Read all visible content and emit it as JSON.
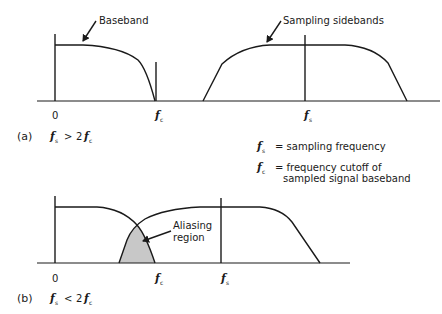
{
  "panel_a": {
    "tag": "(a)",
    "condition": {
      "f1": "f",
      "s1": "s",
      "op": ">",
      "k": "2",
      "f2": "f",
      "s2": "c"
    },
    "callouts": {
      "baseband": "Baseband",
      "sidebands": "Sampling sidebands"
    },
    "ticks": {
      "zero": "0",
      "fc_f": "f",
      "fc_sub": "c",
      "fs_f": "f",
      "fs_sub": "s"
    }
  },
  "panel_b": {
    "tag": "(b)",
    "condition": {
      "f1": "f",
      "s1": "s",
      "op": "<",
      "k": "2",
      "f2": "f",
      "s2": "c"
    },
    "callouts": {
      "aliasing_1": "Aliasing",
      "aliasing_2": "region"
    },
    "ticks": {
      "zero": "0",
      "fc_f": "f",
      "fc_sub": "c",
      "fs_f": "f",
      "fs_sub": "s"
    }
  },
  "legend": {
    "fs": {
      "f": "f",
      "sub": "s",
      "text": "= sampling frequency"
    },
    "fc": {
      "f": "f",
      "sub": "c",
      "text_1": "= frequency cutoff of",
      "text_2": "sampled signal baseband"
    }
  },
  "colors": {
    "line": "#1a1a1a",
    "aliasing_fill": "#c8c8c8",
    "background": "#ffffff"
  }
}
